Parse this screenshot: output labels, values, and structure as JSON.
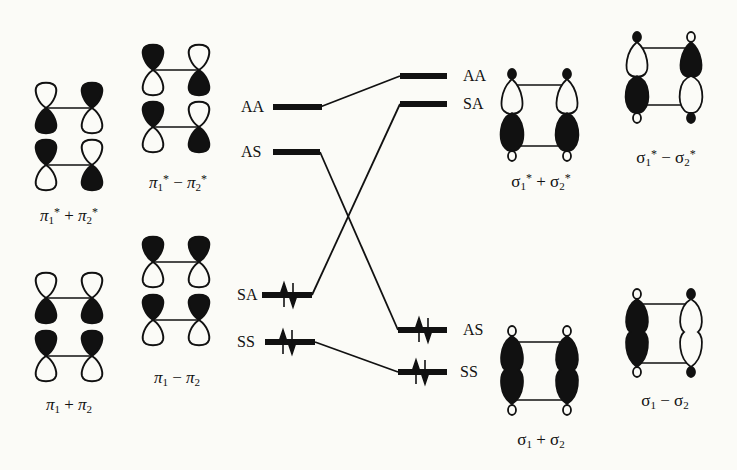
{
  "figure": {
    "type": "molecular-orbital-correlation-diagram",
    "background": "#fbfbf7",
    "ink": "#111111"
  },
  "orbital_labels": {
    "pi_star_plus": {
      "greek": "π",
      "sub1": "1",
      "sup1": "*",
      "op": "+",
      "sub2": "2",
      "sup2": "*",
      "text": "π1* + π2*"
    },
    "pi_star_minus": {
      "greek": "π",
      "sub1": "1",
      "sup1": "*",
      "op": "−",
      "sub2": "2",
      "sup2": "*",
      "text": "π1* − π2*"
    },
    "pi_plus": {
      "greek": "π",
      "sub1": "1",
      "sup1": "",
      "op": "+",
      "sub2": "2",
      "sup2": "",
      "text": "π1 + π2"
    },
    "pi_minus": {
      "greek": "π",
      "sub1": "1",
      "sup1": "",
      "op": "−",
      "sub2": "2",
      "sup2": "",
      "text": "π1 − π2"
    },
    "sigma_star_plus": {
      "greek": "σ",
      "sub1": "1",
      "sup1": "*",
      "op": "+",
      "sub2": "2",
      "sup2": "*",
      "text": "σ1* + σ2*"
    },
    "sigma_star_minus": {
      "greek": "σ",
      "sub1": "1",
      "sup1": "*",
      "op": "−",
      "sub2": "2",
      "sup2": "*",
      "text": "σ1* − σ2*"
    },
    "sigma_plus": {
      "greek": "σ",
      "sub1": "1",
      "sup1": "",
      "op": "+",
      "sub2": "2",
      "sup2": "",
      "text": "σ1 + σ2"
    },
    "sigma_minus": {
      "greek": "σ",
      "sub1": "1",
      "sup1": "",
      "op": "−",
      "sub2": "2",
      "sup2": "",
      "text": "σ1 − σ2"
    }
  },
  "left_levels": [
    {
      "id": "AA",
      "label": "AA",
      "y": 107,
      "x1": 273,
      "x2": 322,
      "electrons": 0
    },
    {
      "id": "AS",
      "label": "AS",
      "y": 152,
      "x1": 273,
      "x2": 320,
      "electrons": 0
    },
    {
      "id": "SA",
      "label": "SA",
      "y": 295,
      "x1": 262,
      "x2": 312,
      "electrons": 2
    },
    {
      "id": "SS",
      "label": "SS",
      "y": 342,
      "x1": 265,
      "x2": 315,
      "electrons": 2
    }
  ],
  "right_levels": [
    {
      "id": "AA",
      "label": "AA",
      "y": 76,
      "x1": 400,
      "x2": 447,
      "electrons": 0
    },
    {
      "id": "SA",
      "label": "SA",
      "y": 104,
      "x1": 400,
      "x2": 447,
      "electrons": 0
    },
    {
      "id": "AS",
      "label": "AS",
      "y": 330,
      "x1": 398,
      "x2": 447,
      "electrons": 2
    },
    {
      "id": "SS",
      "label": "SS",
      "y": 372,
      "x1": 398,
      "x2": 447,
      "electrons": 2
    }
  ],
  "correlations": [
    {
      "from": "AA",
      "to": "AA"
    },
    {
      "from": "AS",
      "to": "AS"
    },
    {
      "from": "SA",
      "to": "SA"
    },
    {
      "from": "SS",
      "to": "SS"
    }
  ],
  "electron_marker": "↑↓"
}
